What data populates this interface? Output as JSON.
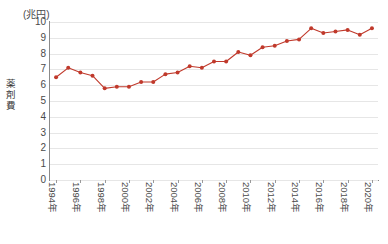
{
  "chart_data": {
    "type": "line",
    "title": "",
    "subtitle": "",
    "unit_label": "(兆円)",
    "ylabel": "薬剤費",
    "xlabel": "",
    "ylim": [
      0,
      10
    ],
    "ytick_values": [
      0,
      1,
      2,
      3,
      4,
      5,
      6,
      7,
      8,
      9,
      10
    ],
    "ytick_labels": [
      "0",
      "1",
      "2",
      "3",
      "4",
      "5",
      "6",
      "7",
      "8",
      "9",
      "10"
    ],
    "grid": true,
    "legend": "none",
    "series_color": "#c0392b",
    "marker": "circle",
    "categories": [
      "1994年",
      "1995年",
      "1996年",
      "1997年",
      "1998年",
      "1999年",
      "2000年",
      "2001年",
      "2002年",
      "2003年",
      "2004年",
      "2005年",
      "2006年",
      "2007年",
      "2008年",
      "2009年",
      "2010年",
      "2011年",
      "2012年",
      "2013年",
      "2014年",
      "2015年",
      "2016年",
      "2017年",
      "2018年",
      "2019年",
      "2020年"
    ],
    "xtick_labels": [
      "1994年",
      "1996年",
      "1998年",
      "2000年",
      "2002年",
      "2004年",
      "2006年",
      "2008年",
      "2010年",
      "2012年",
      "2014年",
      "2016年",
      "2018年",
      "2020年"
    ],
    "values": [
      6.5,
      7.1,
      6.8,
      6.6,
      5.8,
      5.9,
      5.9,
      6.2,
      6.2,
      6.7,
      6.8,
      7.2,
      7.1,
      7.5,
      7.5,
      8.1,
      7.9,
      8.4,
      8.5,
      8.8,
      8.9,
      9.6,
      9.3,
      9.4,
      9.5,
      9.2,
      9.6
    ],
    "series": [
      {
        "name": "薬剤費",
        "values": [
          6.5,
          7.1,
          6.8,
          6.6,
          5.8,
          5.9,
          5.9,
          6.2,
          6.2,
          6.7,
          6.8,
          7.2,
          7.1,
          7.5,
          7.5,
          8.1,
          7.9,
          8.4,
          8.5,
          8.8,
          8.9,
          9.6,
          9.3,
          9.4,
          9.5,
          9.2,
          9.6
        ]
      }
    ]
  },
  "footnote": ""
}
